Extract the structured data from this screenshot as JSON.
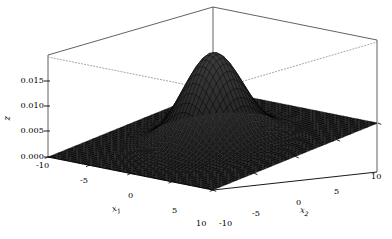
{
  "figure": {
    "type": "3d-surface-plot",
    "background_color": "#ffffff",
    "width": 392,
    "height": 239
  },
  "axes": {
    "x1": {
      "title": "x",
      "subscript": "1",
      "tick_labels": [
        "-10",
        "-5",
        "0",
        "5",
        "10"
      ],
      "ticks": [
        -10,
        -5,
        0,
        5,
        10
      ],
      "range": [
        -10,
        10
      ]
    },
    "x2": {
      "title": "x",
      "subscript": "2",
      "tick_labels": [
        "-10",
        "-5",
        "0",
        "5",
        "10"
      ],
      "ticks": [
        -10,
        -5,
        0,
        5,
        10
      ],
      "range": [
        -10,
        10
      ]
    },
    "z": {
      "title": "z",
      "tick_labels": [
        "0.000",
        "0.005",
        "0.010",
        "0.015"
      ],
      "ticks": [
        0.0,
        0.005,
        0.01,
        0.015
      ],
      "range": [
        0.0,
        0.0175
      ]
    }
  },
  "chart_data": {
    "type": "surface",
    "title": "",
    "xlabel": "x1",
    "ylabel": "x2",
    "zlabel": "z",
    "xlim": [
      -10,
      10
    ],
    "ylim": [
      -10,
      10
    ],
    "zlim": [
      0.0,
      0.0175
    ],
    "grid": false,
    "legend": "none",
    "surface_color": "#2b2b2b",
    "edge_color": "#000000",
    "mesh_n": 48,
    "function": "z = A * exp(-((x1^2 + x2^2) / (2*sigma^2)))",
    "peak_value": 0.0172,
    "peak_location": [
      0,
      0
    ],
    "sigma": 2.6,
    "xtick_labels": [
      "-10",
      "-5",
      "0",
      "5",
      "10"
    ],
    "ytick_labels": [
      "-10",
      "-5",
      "0",
      "5",
      "10"
    ],
    "ztick_labels": [
      "0.000",
      "0.005",
      "0.010",
      "0.015"
    ],
    "z_values_at_ticks": [
      0.0,
      0.005,
      0.01,
      0.015
    ]
  },
  "view": {
    "elevation_hint": "low",
    "azimuth_hint": "front-corner",
    "box_style": "open-3d-box",
    "back_bottom_edges": "dotted"
  }
}
